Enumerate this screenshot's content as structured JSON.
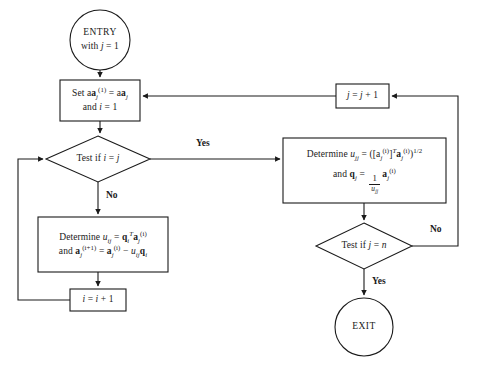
{
  "diagram": {
    "type": "flowchart",
    "background_color": "#ffffff",
    "stroke_color": "#1a1a1a",
    "canvas": {
      "width": 477,
      "height": 366
    }
  },
  "nodes": {
    "entry": {
      "shape": "circle",
      "line1": "ENTRY",
      "line2_prefix": "with ",
      "line2_var": "j",
      "line2_suffix": " = 1"
    },
    "init": {
      "shape": "process",
      "line1_prefix": "Set a",
      "line1_sub": "j",
      "line1_sup": "(1)",
      "line1_mid": " = a",
      "line1_sub2": "j",
      "line2_prefix": "and ",
      "line2_var": "i",
      "line2_suffix": " = 1"
    },
    "test_ij": {
      "shape": "decision",
      "prefix": "Test if ",
      "var1": "i",
      "mid": " = ",
      "var2": "j"
    },
    "determine_uij": {
      "shape": "process",
      "line1_prefix": "Determine ",
      "line1_u": "u",
      "line1_usub": "ij",
      "line1_eq": " = ",
      "line1_q": "q",
      "line1_qsub": "i",
      "line1_qsup": "T",
      "line1_a": "a",
      "line1_asub": "j",
      "line1_asup": "(i)",
      "line2_prefix": "and ",
      "line2_a1": "a",
      "line2_a1sub": "j",
      "line2_a1sup": "(i+1)",
      "line2_eq": " = ",
      "line2_a2": "a",
      "line2_a2sub": "j",
      "line2_a2sup": "(i)",
      "line2_minus": " − ",
      "line2_u": "u",
      "line2_usub": "ij",
      "line2_q": "q",
      "line2_qsub": "i"
    },
    "incr_i": {
      "shape": "process",
      "var1": "i",
      "eq": " = ",
      "var2": "i",
      "plus": " + 1"
    },
    "determine_ujj": {
      "shape": "process",
      "line1_prefix": "Determine ",
      "line1_u": "u",
      "line1_usub": "jj",
      "line1_eq": " = ([a",
      "line1_asub": "j",
      "line1_asup": "(i)",
      "line1_bracket": "]",
      "line1_T": "T",
      "line1_a2": "a",
      "line1_a2sub": "j",
      "line1_a2sup": "(i)",
      "line1_close": ")",
      "line1_half": "1/2",
      "line2_prefix": "and ",
      "line2_q": "q",
      "line2_qsub": "j",
      "line2_eq": " = ",
      "line2_frac_num": "1",
      "line2_frac_den_u": "u",
      "line2_frac_den_sub": "jj",
      "line2_a": "a",
      "line2_asub": "j",
      "line2_asup": "(i)"
    },
    "incr_j": {
      "shape": "process",
      "var1": "j",
      "eq": " = ",
      "var2": "j",
      "plus": " + 1"
    },
    "test_jn": {
      "shape": "decision",
      "prefix": "Test if ",
      "var1": "j",
      "mid": " = ",
      "var2": "n"
    },
    "exit": {
      "shape": "circle",
      "label": "EXIT"
    }
  },
  "edge_labels": {
    "yes_ij": "Yes",
    "no_ij": "No",
    "no_jn": "No",
    "yes_jn": "Yes"
  }
}
